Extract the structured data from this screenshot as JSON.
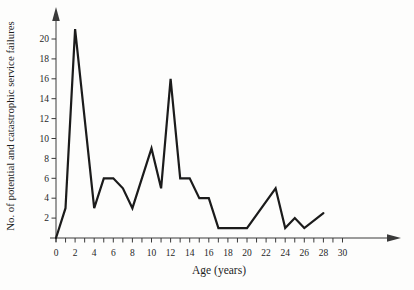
{
  "page": {
    "background": "#fdfdfc"
  },
  "chart_data": {
    "type": "line",
    "title": "",
    "xlabel": "Age (years)",
    "ylabel": "No. of potential and catastrophic service failures",
    "points": [
      [
        0,
        0
      ],
      [
        1,
        3
      ],
      [
        2,
        21
      ],
      [
        4,
        3
      ],
      [
        5,
        6
      ],
      [
        6,
        6
      ],
      [
        7,
        5
      ],
      [
        8,
        3
      ],
      [
        9,
        6
      ],
      [
        10,
        9
      ],
      [
        11,
        5
      ],
      [
        12,
        16
      ],
      [
        13,
        6
      ],
      [
        14,
        6
      ],
      [
        15,
        4
      ],
      [
        16,
        4
      ],
      [
        17,
        1
      ],
      [
        20,
        1
      ],
      [
        23,
        5
      ],
      [
        24,
        1
      ],
      [
        25,
        2
      ],
      [
        26,
        1
      ],
      [
        28,
        2.5
      ]
    ],
    "x_tick_labels": [
      "0",
      "2",
      "4",
      "6",
      "8",
      "10",
      "12",
      "14",
      "16",
      "18",
      "20",
      "22",
      "24",
      "26",
      "28",
      "30"
    ],
    "x_tick_values": [
      0,
      2,
      4,
      6,
      8,
      10,
      12,
      14,
      16,
      18,
      20,
      22,
      24,
      26,
      28,
      30
    ],
    "x_minor_tick_step": 1,
    "x_minor_tick_max": 30,
    "y_tick_labels": [
      "2",
      "4",
      "6",
      "8",
      "10",
      "12",
      "14",
      "16",
      "18",
      "20"
    ],
    "y_tick_values": [
      2,
      4,
      6,
      8,
      10,
      12,
      14,
      16,
      18,
      20
    ],
    "xlim": [
      0,
      31
    ],
    "ylim": [
      0,
      22.5
    ],
    "grid": false,
    "legend": null,
    "axes_arrows": true,
    "line_color": "#1b1b1b",
    "axis_color": "#3a3a3a",
    "label_color": "#262626"
  }
}
